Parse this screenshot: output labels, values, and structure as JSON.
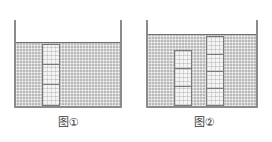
{
  "page": {
    "background_color": "#ffffff",
    "width": 272,
    "height": 142
  },
  "palette": {
    "water_fill": "#b9b9b9",
    "block_fill": "#f4f4f4",
    "outline": "#7a7a7a",
    "wall": "#8b8b8b",
    "water_surface_line": "#6f6f6f",
    "caption_text": "#3a3a3a"
  },
  "figures": [
    {
      "id": "figure-1",
      "caption": "图①",
      "vessel": {
        "label": "container",
        "wall_left_label": "left-wall",
        "wall_right_label": "right-wall",
        "base_label": "base"
      },
      "water": {
        "label": "water",
        "level_percent": 73,
        "surface_visible": true
      },
      "block_columns": [
        {
          "label": "block-stack-single",
          "block_count": 3,
          "top_above_water": false,
          "blocks": [
            "block-1",
            "block-2",
            "block-3"
          ]
        }
      ]
    },
    {
      "id": "figure-2",
      "caption": "图②",
      "vessel": {
        "label": "container",
        "wall_left_label": "left-wall",
        "wall_right_label": "right-wall",
        "base_label": "base"
      },
      "water": {
        "label": "water",
        "level_percent": 82,
        "surface_visible": true
      },
      "block_columns": [
        {
          "label": "block-stack-left",
          "block_count": 3,
          "top_above_water": false,
          "blocks": [
            "block-1",
            "block-2",
            "block-3"
          ]
        },
        {
          "label": "block-stack-right",
          "block_count": 4,
          "top_above_water": true,
          "blocks": [
            "block-1",
            "block-2",
            "block-3",
            "block-4"
          ]
        }
      ]
    }
  ]
}
